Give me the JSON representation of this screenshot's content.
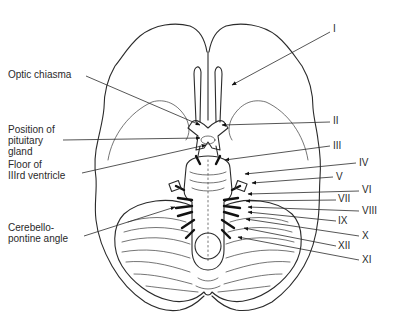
{
  "figure": {
    "left_labels": [
      {
        "id": "optic-chiasma",
        "lines": [
          "Optic chiasma"
        ],
        "x": 8,
        "y": 78,
        "leader": [
          [
            86,
            76
          ],
          [
            200,
            125
          ]
        ]
      },
      {
        "id": "pituitary",
        "lines": [
          "Position of",
          "pituitary",
          "gland"
        ],
        "x": 8,
        "y": 133,
        "leader": [
          [
            63,
            140
          ],
          [
            200,
            138
          ]
        ]
      },
      {
        "id": "third-ventricle",
        "lines": [
          "Floor of",
          "IIIrd ventricle"
        ],
        "x": 8,
        "y": 168,
        "leader": [
          [
            82,
            173
          ],
          [
            206,
            145
          ]
        ]
      },
      {
        "id": "cerebellopontine",
        "lines": [
          "Cerebello-",
          "pontine angle"
        ],
        "x": 8,
        "y": 231,
        "leader": [
          [
            84,
            236
          ],
          [
            175,
            207
          ]
        ]
      }
    ],
    "right_labels": [
      {
        "id": "nerve-I",
        "text": "I",
        "x": 333,
        "y": 32,
        "leader": [
          [
            330,
            32
          ],
          [
            232,
            85
          ]
        ]
      },
      {
        "id": "nerve-II",
        "text": "II",
        "x": 333,
        "y": 124,
        "leader": [
          [
            330,
            122
          ],
          [
            222,
            125
          ]
        ]
      },
      {
        "id": "nerve-III",
        "text": "III",
        "x": 333,
        "y": 149,
        "leader": [
          [
            330,
            146
          ],
          [
            225,
            160
          ]
        ]
      },
      {
        "id": "nerve-IV",
        "text": "IV",
        "x": 359,
        "y": 166,
        "leader": [
          [
            356,
            163
          ],
          [
            245,
            174
          ]
        ]
      },
      {
        "id": "nerve-V",
        "text": "V",
        "x": 336,
        "y": 180,
        "leader": [
          [
            333,
            177
          ],
          [
            252,
            183
          ]
        ]
      },
      {
        "id": "nerve-VI",
        "text": "VI",
        "x": 362,
        "y": 193,
        "leader": [
          [
            359,
            191
          ],
          [
            248,
            194
          ]
        ]
      },
      {
        "id": "nerve-VII",
        "text": "VII",
        "x": 338,
        "y": 202,
        "leader": [
          [
            336,
            200
          ],
          [
            246,
            201
          ]
        ]
      },
      {
        "id": "nerve-VIII",
        "text": "VIII",
        "x": 362,
        "y": 214,
        "leader": [
          [
            359,
            211
          ],
          [
            248,
            207
          ]
        ]
      },
      {
        "id": "nerve-IX",
        "text": "IX",
        "x": 338,
        "y": 224,
        "leader": [
          [
            336,
            221
          ],
          [
            248,
            212
          ]
        ]
      },
      {
        "id": "nerve-X",
        "text": "X",
        "x": 362,
        "y": 239,
        "leader": [
          [
            359,
            236
          ],
          [
            246,
            219
          ]
        ]
      },
      {
        "id": "nerve-XII",
        "text": "XII",
        "x": 338,
        "y": 249,
        "leader": [
          [
            336,
            246
          ],
          [
            244,
            228
          ]
        ]
      },
      {
        "id": "nerve-XI",
        "text": "XI",
        "x": 362,
        "y": 263,
        "leader": [
          [
            359,
            260
          ],
          [
            238,
            237
          ]
        ]
      }
    ],
    "colors": {
      "line": "#2b2b2b",
      "text": "#2a2a2a",
      "background": "#ffffff"
    }
  }
}
